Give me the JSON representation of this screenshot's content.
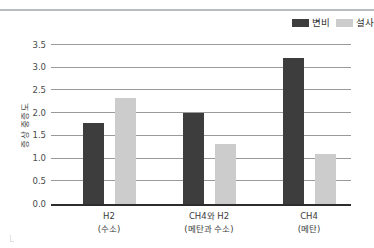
{
  "chart_data": {
    "type": "bar",
    "title": "",
    "xlabel": "",
    "ylabel": "증상 중증도",
    "ylim": [
      0.0,
      3.5
    ],
    "ytick_step": 0.5,
    "yticks": [
      "0.0",
      "0.5",
      "1.0",
      "1.5",
      "2.0",
      "2.5",
      "3.0",
      "3.5"
    ],
    "ytick_values": [
      0.0,
      0.5,
      1.0,
      1.5,
      2.0,
      2.5,
      3.0,
      3.5
    ],
    "grid": "horizontal",
    "legend_position": "top-right",
    "categories": [
      "H2",
      "CH4와 H2",
      "CH4"
    ],
    "category_sublabels": [
      "(수소)",
      "(메탄과 수소)",
      "(메탄)"
    ],
    "series": [
      {
        "name": "변비",
        "color": "#3d3d3d",
        "values": [
          1.79,
          2.01,
          3.22
        ]
      },
      {
        "name": "설사",
        "color": "#cccccc",
        "values": [
          2.33,
          1.33,
          1.11
        ]
      }
    ]
  },
  "legend": {
    "items": [
      {
        "label": "변비",
        "color": "#3d3d3d"
      },
      {
        "label": "설사",
        "color": "#cccccc"
      }
    ]
  },
  "colors": {
    "series_dark": "#3d3d3d",
    "series_light": "#cccccc",
    "gridline": "#9a9a9a",
    "axis": "#2d2d2d",
    "top_rule": "#b9bcbe",
    "text": "#3a3a3a"
  }
}
